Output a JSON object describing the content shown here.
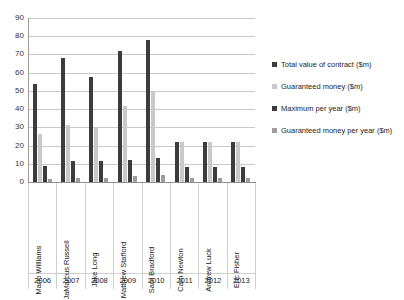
{
  "chart_data": {
    "type": "bar",
    "title": "",
    "xlabel": "",
    "ylabel": "",
    "ylim": [
      0,
      90
    ],
    "yticks": [
      0,
      10,
      20,
      30,
      40,
      50,
      60,
      70,
      80,
      90
    ],
    "grid": true,
    "legend_position": "right",
    "categories": [
      "Mario Williams",
      "JaMarcus Russell",
      "Jake Long",
      "Matthew Stafford",
      "Sam Bradford",
      "Cam Newton",
      "Andrew Luck",
      "Eric Fisher"
    ],
    "subcategories": [
      "2006",
      "2007",
      "2008",
      "2009",
      "2010",
      "2011",
      "2012",
      "2013"
    ],
    "series": [
      {
        "name": "Total value of contract ($m)",
        "color": "#3c3c3c",
        "values": [
          54,
          68,
          57.75,
          72,
          78,
          22,
          22,
          22
        ]
      },
      {
        "name": "Guaranteed money ($m)",
        "color": "#c9c9c9",
        "values": [
          26.5,
          31.5,
          30,
          41.7,
          50,
          22,
          22,
          22
        ]
      },
      {
        "name": "Maximum per year ($m)",
        "color": "#3c3c3c",
        "values": [
          9,
          11.3,
          11.5,
          12,
          13,
          8,
          8,
          8
        ]
      },
      {
        "name": "Guaranteed money per year ($m)",
        "color": "#9d9d9d",
        "values": [
          1.5,
          2,
          2,
          3.5,
          4,
          2,
          2,
          2
        ]
      }
    ]
  },
  "legend": {
    "items": [
      {
        "label": "Total value of contract ($m)",
        "color": "#3c3c3c"
      },
      {
        "label": "Guaranteed money ($m)",
        "color": "#c9c9c9"
      },
      {
        "label": "Maximum per year ($m)",
        "color": "#3c3c3c"
      },
      {
        "label": "Guaranteed money per year ($m)",
        "color": "#9d9d9d"
      }
    ]
  }
}
